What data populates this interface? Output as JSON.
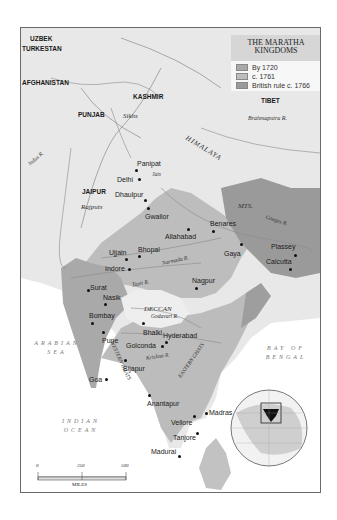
{
  "title": "THE MARATHA KINGDOMS",
  "title_lines": [
    "THE MARATHA",
    "KINGDOMS"
  ],
  "legend": [
    {
      "label": "By 1720",
      "color": "#a9a9a9"
    },
    {
      "label": "c. 1761",
      "color": "#bdbdbd"
    },
    {
      "label": "British rule c. 1766",
      "color": "#9a9a9a"
    }
  ],
  "regions": {
    "uzbek": "UZBEK",
    "turkestan": "TURKESTAN",
    "afghanistan": "AFGHANISTAN",
    "kashmir": "KASHMIR",
    "punjab": "PUNJAB",
    "tibet": "TIBET",
    "jaipur": "JAIPUR",
    "ceylon": "CEYLON",
    "deccan": "DECCAN"
  },
  "peoples": {
    "sikhs": "Sikhs",
    "rajputs": "Rajputs",
    "jats": "Jats"
  },
  "rivers": {
    "indus": "Indus R.",
    "brahmaputra": "Brahmaputra R.",
    "ganges": "Ganges R.",
    "narmada": "Narmada R.",
    "tapti": "Tapti R.",
    "godavari": "Godavari R.",
    "krishna": "Krishna R."
  },
  "mountains": {
    "himalaya": "HIMALAYA",
    "mts": "MTS.",
    "western_ghats": "WESTERN GHATS",
    "eastern_ghats": "EASTERN GHATS"
  },
  "seas": {
    "arabian_1": "ARABIAN",
    "arabian_2": "SEA",
    "bengal_1": "BAY OF",
    "bengal_2": "BENGAL",
    "indian_1": "INDIAN",
    "indian_2": "OCEAN"
  },
  "cities": [
    {
      "name": "Panipat"
    },
    {
      "name": "Delhi"
    },
    {
      "name": "Dhaulpur"
    },
    {
      "name": "Gwalior"
    },
    {
      "name": "Allahabad"
    },
    {
      "name": "Benares"
    },
    {
      "name": "Gaya"
    },
    {
      "name": "Plassey"
    },
    {
      "name": "Calcutta"
    },
    {
      "name": "Ujjain"
    },
    {
      "name": "Bhopal"
    },
    {
      "name": "Indore"
    },
    {
      "name": "Surat"
    },
    {
      "name": "Nagpur"
    },
    {
      "name": "Nasik"
    },
    {
      "name": "Bombay"
    },
    {
      "name": "Bhalki"
    },
    {
      "name": "Pune"
    },
    {
      "name": "Hyderabad"
    },
    {
      "name": "Golconda"
    },
    {
      "name": "Bijapur"
    },
    {
      "name": "Goa"
    },
    {
      "name": "Anantapur"
    },
    {
      "name": "Madras"
    },
    {
      "name": "Vellore"
    },
    {
      "name": "Tanjore"
    },
    {
      "name": "Madurai"
    }
  ],
  "scale": {
    "ticks": [
      "0",
      "250",
      "500"
    ],
    "unit": "MILES"
  }
}
